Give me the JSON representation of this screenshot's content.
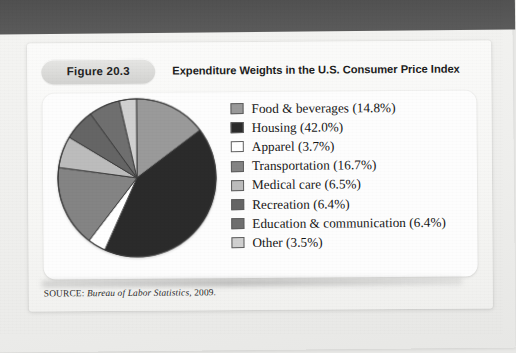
{
  "figure": {
    "badge": "Figure 20.3",
    "title": "Expenditure Weights in the U.S. Consumer Price Index",
    "source_prefix": "SOURCE: ",
    "source_italic": "Bureau of Labor Statistics",
    "source_suffix": ", 2009."
  },
  "chart_data": {
    "type": "pie",
    "title": "Expenditure Weights in the U.S. Consumer Price Index",
    "unit": "%",
    "start_angle_deg": 0,
    "direction": "clockwise",
    "legend_position": "right",
    "grid": false,
    "categories": [
      "Food & beverages",
      "Housing",
      "Apparel",
      "Transportation",
      "Medical care",
      "Recreation",
      "Education & communication",
      "Other"
    ],
    "values": [
      14.8,
      42.0,
      3.7,
      16.7,
      6.5,
      6.4,
      6.4,
      3.5
    ],
    "colors": [
      "#9a9a9a",
      "#2b2b2b",
      "#ffffff",
      "#848484",
      "#bcbcbc",
      "#656565",
      "#6f6f6f",
      "#d0d0d0"
    ],
    "slices": [
      {
        "label": "Food & beverages",
        "value": 14.8,
        "display": "Food & beverages (14.8%)",
        "color": "#9a9a9a"
      },
      {
        "label": "Housing",
        "value": 42.0,
        "display": "Housing (42.0%)",
        "color": "#2b2b2b"
      },
      {
        "label": "Apparel",
        "value": 3.7,
        "display": "Apparel (3.7%)",
        "color": "#ffffff"
      },
      {
        "label": "Transportation",
        "value": 16.7,
        "display": "Transportation (16.7%)",
        "color": "#848484"
      },
      {
        "label": "Medical care",
        "value": 6.5,
        "display": "Medical care (6.5%)",
        "color": "#bcbcbc"
      },
      {
        "label": "Recreation",
        "value": 6.4,
        "display": "Recreation (6.4%)",
        "color": "#656565"
      },
      {
        "label": "Education & communication",
        "value": 6.4,
        "display": "Education & communication (6.4%)",
        "color": "#6f6f6f"
      },
      {
        "label": "Other",
        "value": 3.5,
        "display": "Other (3.5%)",
        "color": "#d0d0d0"
      }
    ]
  }
}
